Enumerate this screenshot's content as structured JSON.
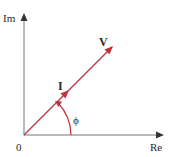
{
  "diagram": {
    "type": "phasor-diagram",
    "axes": {
      "vertical_label": "Im",
      "horizontal_label": "Re",
      "origin_label": "0",
      "axis_color": "#555555"
    },
    "phasors": [
      {
        "label": "V",
        "color": "#c0313b"
      },
      {
        "label": "I",
        "color": "#c0313b"
      }
    ],
    "angle": {
      "label": "ϕ",
      "color": "#c0313b"
    }
  }
}
